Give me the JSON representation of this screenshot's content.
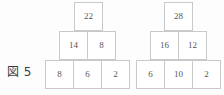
{
  "figure": {
    "label": "図 5",
    "colors": {
      "background": "#fdfdfd",
      "cell_background": "#ffffff",
      "border": "#c9c9c9",
      "number_text": "#555555",
      "label_text": "#3a3a3a"
    }
  },
  "chart_data": {
    "type": "table",
    "title": "図 5",
    "xlabel": "",
    "ylabel": "",
    "pyramids": [
      {
        "name": "left-pyramid",
        "rows": [
          {
            "name": "top-row",
            "values": [
              22
            ]
          },
          {
            "name": "middle-row",
            "values": [
              14,
              8
            ]
          },
          {
            "name": "bottom-row",
            "values": [
              8,
              6,
              2
            ]
          }
        ]
      },
      {
        "name": "right-pyramid",
        "rows": [
          {
            "name": "top-row",
            "values": [
              28
            ]
          },
          {
            "name": "middle-row",
            "values": [
              16,
              12
            ]
          },
          {
            "name": "bottom-row",
            "values": [
              6,
              10,
              2
            ]
          }
        ]
      }
    ]
  }
}
